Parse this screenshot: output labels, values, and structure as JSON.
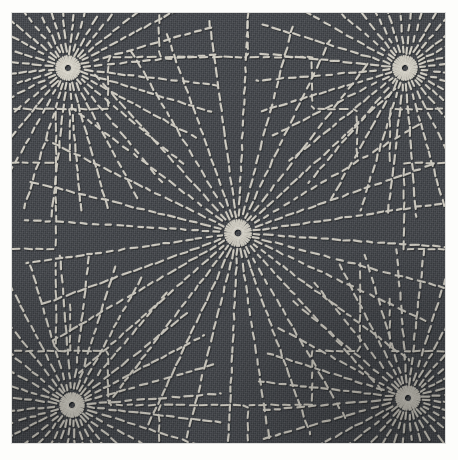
{
  "image": {
    "title": "Sashiko embroidered textile",
    "subject": "hand-stitched radial starburst (kiku / chrysanthemum-ray) sashiko pattern",
    "medium": "running-stitch embroidery on woven cotton",
    "width": 458,
    "height": 460
  },
  "palette": {
    "paper_margin": "#fdfdfb",
    "fabric_base": "#494c51",
    "fabric_shadow": "#33363a",
    "fabric_highlight": "#5a5e64",
    "thread_light": "#e3e0d6",
    "thread_mid": "#c9c5b9",
    "thread_shadow": "#8e8b82"
  },
  "canvas": {
    "fabric_left": 12,
    "fabric_top": 13,
    "fabric_width": 433,
    "fabric_height": 430
  },
  "stitch": {
    "dash_length": 6.0,
    "gap_length": 4.4,
    "stroke_width": 2.2,
    "cap": "round"
  },
  "motifs": [
    {
      "name": "center-burst",
      "cx": 226,
      "cy": 220,
      "rays": 32,
      "inner_radius": 13,
      "outer_radius": 215,
      "knot_radius": 11
    },
    {
      "name": "corner-burst-tl",
      "cx": 56,
      "cy": 55,
      "rays": 32,
      "inner_radius": 11,
      "outer_radius": 150,
      "knot_radius": 10
    },
    {
      "name": "corner-burst-tr",
      "cx": 393,
      "cy": 55,
      "rays": 32,
      "inner_radius": 11,
      "outer_radius": 150,
      "knot_radius": 10
    },
    {
      "name": "corner-burst-bl",
      "cx": 60,
      "cy": 392,
      "rays": 32,
      "inner_radius": 11,
      "outer_radius": 150,
      "knot_radius": 10
    },
    {
      "name": "corner-burst-br",
      "cx": 396,
      "cy": 385,
      "rays": 32,
      "inner_radius": 11,
      "outer_radius": 150,
      "knot_radius": 10
    }
  ],
  "stepped_borders": {
    "name": "stepped-boundary-lines",
    "description": "orthogonal stepped seams separating the ray fields",
    "count": 12
  }
}
